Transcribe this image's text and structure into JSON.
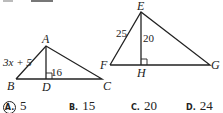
{
  "problem": {
    "triangle1": {
      "vertices": {
        "A": "A",
        "B": "B",
        "C": "C",
        "D": "D"
      },
      "side_AB": "3x + 5",
      "altitude_AD": "16"
    },
    "triangle2": {
      "vertices": {
        "E": "E",
        "F": "F",
        "G": "G",
        "H": "H"
      },
      "side_EF": "25",
      "altitude_EH": "20"
    }
  },
  "choices": [
    {
      "letter": "A.",
      "value": "5",
      "selected": true
    },
    {
      "letter": "B.",
      "value": "15",
      "selected": false
    },
    {
      "letter": "C.",
      "value": "20",
      "selected": false
    },
    {
      "letter": "D.",
      "value": "24",
      "selected": false
    }
  ]
}
